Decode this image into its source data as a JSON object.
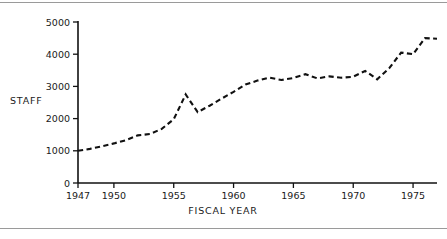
{
  "figure": {
    "has_top_rule": true,
    "has_bottom_rule": true,
    "rule_color": "#9a9a9a",
    "line_color": "#111111",
    "background": "#ffffff"
  },
  "chart_data": {
    "type": "line",
    "title": "",
    "xlabel": "FISCAL YEAR",
    "ylabel": "STAFF",
    "style": "dashed",
    "grid": false,
    "legend": null,
    "xlim": [
      1947,
      1977
    ],
    "ylim": [
      0,
      5000
    ],
    "xticks": [
      1947,
      1950,
      1955,
      1960,
      1965,
      1970,
      1975
    ],
    "xtick_labels": [
      "1947",
      "1950",
      "1955",
      "1960",
      "1965",
      "1970",
      "1975"
    ],
    "yticks": [
      0,
      1000,
      2000,
      3000,
      4000,
      5000
    ],
    "ytick_labels": [
      "0",
      "1000",
      "2000",
      "3000",
      "4000",
      "5000"
    ],
    "x": [
      1947,
      1948,
      1949,
      1950,
      1951,
      1952,
      1953,
      1954,
      1955,
      1956,
      1957,
      1958,
      1959,
      1960,
      1961,
      1962,
      1963,
      1964,
      1965,
      1966,
      1967,
      1968,
      1969,
      1970,
      1971,
      1972,
      1973,
      1974,
      1975,
      1976,
      1977
    ],
    "values": [
      1000,
      1060,
      1140,
      1230,
      1330,
      1480,
      1520,
      1680,
      1980,
      2750,
      2200,
      2400,
      2620,
      2830,
      3060,
      3180,
      3270,
      3200,
      3260,
      3380,
      3250,
      3310,
      3270,
      3300,
      3480,
      3220,
      3560,
      4050,
      4000,
      4500,
      4480
    ]
  }
}
